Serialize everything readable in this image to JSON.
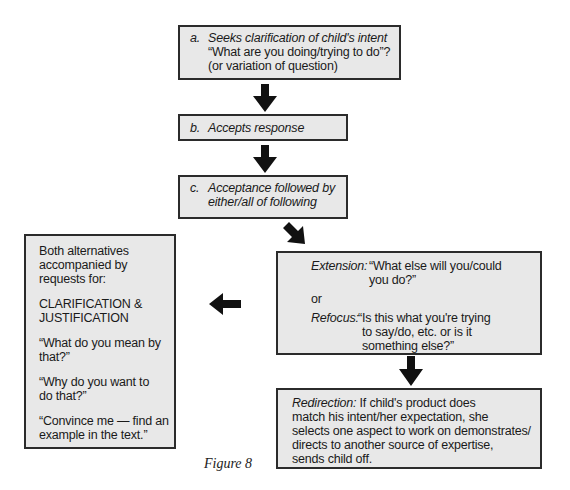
{
  "diagram": {
    "box_a": {
      "label": "a.",
      "title": "Seeks clarification of child's intent",
      "line2": "“What are you doing/trying to do”?",
      "line3": "(or variation of question)"
    },
    "box_b": {
      "label": "b.",
      "title": "Accepts response"
    },
    "box_c": {
      "label": "c.",
      "line1": "Acceptance followed by",
      "line2": "either/all of following"
    },
    "box_left": {
      "intro_lines": [
        "Both alternatives",
        "accompanied by",
        "requests for:"
      ],
      "heading_lines": [
        "CLARIFICATION &",
        "JUSTIFICATION"
      ],
      "quote1_lines": [
        "“What do you mean by",
        "that?”"
      ],
      "quote2_lines": [
        "“Why do you want to",
        "do that?”"
      ],
      "quote3_lines": [
        "“Convince me — find an",
        "example in the text.”"
      ]
    },
    "box_extension": {
      "extension_label": "Extension:",
      "extension_lines": [
        "“What else will you/could",
        "you do?”"
      ],
      "or_text": "or",
      "refocus_label": "Refocus:",
      "refocus_lines": [
        "“Is this what you're trying",
        "to say/do, etc. or is it",
        "something else?”"
      ]
    },
    "box_redirection": {
      "label": "Redirection:",
      "line1_rest": "If child's product does",
      "lines": [
        "match his intent/her expectation, she",
        "selects one aspect to work on demonstrates/",
        "directs to another source of expertise,",
        "sends child off."
      ]
    },
    "arrows": [
      {
        "name": "down-arrow-a-to-b",
        "direction": "down"
      },
      {
        "name": "down-arrow-b-to-c",
        "direction": "down"
      },
      {
        "name": "diagonal-arrow-c-to-extension",
        "direction": "down-right"
      },
      {
        "name": "left-arrow-extension-to-left-box",
        "direction": "left"
      },
      {
        "name": "down-arrow-extension-to-redirection",
        "direction": "down"
      }
    ],
    "caption": "Figure 8",
    "colors": {
      "box_fill": "#e8e8e8",
      "box_border": "#2b2b2b",
      "arrow": "#111111",
      "text": "#1a1a1a"
    }
  }
}
